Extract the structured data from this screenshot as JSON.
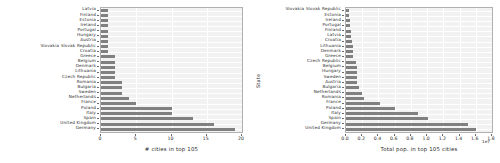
{
  "chart_data": [
    {
      "type": "bar",
      "orientation": "horizontal",
      "panel": "left",
      "title": "",
      "xlabel": "# cities in top 105",
      "ylabel": "",
      "xlim": [
        0,
        20
      ],
      "xticks": [
        "0",
        "5",
        "10",
        "15",
        "20"
      ],
      "xtick_values": [
        0,
        5,
        10,
        15,
        20
      ],
      "grid": true,
      "bar_color": "#808080",
      "categories": [
        "Latvia",
        "Finland",
        "Estonia",
        "Ireland",
        "Portugal",
        "Hungary",
        "Austria",
        "Slovakia Slovak Republic",
        "Croatia",
        "Greece",
        "Belgium",
        "Denmark",
        "Lithuania",
        "Czech Republic",
        "Romania",
        "Bulgaria",
        "Sweden",
        "Netherlands",
        "France",
        "Poland",
        "Italy",
        "Spain",
        "United Kingdom",
        "Germany"
      ],
      "values": [
        1,
        1,
        1,
        1,
        1,
        1,
        1,
        1,
        1,
        2,
        2,
        2,
        2,
        2,
        3,
        3,
        3,
        4,
        5,
        10,
        10,
        13,
        16,
        19
      ]
    },
    {
      "type": "bar",
      "orientation": "horizontal",
      "panel": "right",
      "title": "",
      "xlabel": "Total pop. in top 105 cities",
      "ylabel": "State",
      "x_exponent": "1e7",
      "xlim": [
        0,
        1.8
      ],
      "xticks": [
        "0.0",
        "0.2",
        "0.4",
        "0.6",
        "0.8",
        "1.0",
        "1.2",
        "1.4",
        "1.6",
        "1.8"
      ],
      "xtick_values": [
        0.0,
        0.2,
        0.4,
        0.6,
        0.8,
        1.0,
        1.2,
        1.4,
        1.6,
        1.8
      ],
      "grid": true,
      "bar_color": "#808080",
      "categories": [
        "Slovakia Slovak Republic",
        "Estonia",
        "Ireland",
        "Portugal",
        "Finland",
        "Latvia",
        "Croatia",
        "Lithuania",
        "Denmark",
        "Greece",
        "Czech Republic",
        "Belgium",
        "Hungary",
        "Sweden",
        "Austria",
        "Bulgaria",
        "Netherlands",
        "Romania",
        "France",
        "Poland",
        "Italy",
        "Spain",
        "Germany",
        "United Kingdom"
      ],
      "values": [
        0.043,
        0.043,
        0.052,
        0.053,
        0.062,
        0.064,
        0.079,
        0.083,
        0.087,
        0.089,
        0.125,
        0.131,
        0.133,
        0.135,
        0.141,
        0.165,
        0.2,
        0.222,
        0.42,
        0.6,
        0.89,
        1.01,
        1.5,
        1.6
      ]
    }
  ]
}
